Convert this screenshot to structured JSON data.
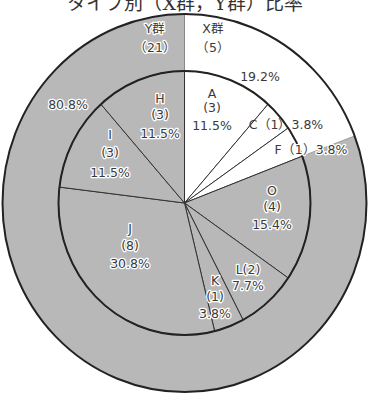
{
  "chart_data": {
    "type": "pie",
    "subtype": "double-ring (nested pie)",
    "title": "タイプ別（X群，Y群）比率",
    "title_visible_partial": true,
    "total": 26,
    "outer_ring": [
      {
        "name": "X群",
        "count": 5,
        "percent": 19.2,
        "color": "#ffffff"
      },
      {
        "name": "Y群",
        "count": 21,
        "percent": 80.8,
        "color": "#b8b8b8"
      }
    ],
    "inner_pie": [
      {
        "name": "A",
        "count": 3,
        "percent": 11.5,
        "group": "X群",
        "color": "#ffffff"
      },
      {
        "name": "C",
        "count": 1,
        "percent": 3.8,
        "group": "X群",
        "color": "#ffffff"
      },
      {
        "name": "F",
        "count": 1,
        "percent": 3.8,
        "group": "X群",
        "color": "#ffffff"
      },
      {
        "name": "O",
        "count": 4,
        "percent": 15.4,
        "group": "Y群",
        "color": "#b8b8b8"
      },
      {
        "name": "L",
        "count": 2,
        "percent": 7.7,
        "group": "Y群",
        "color": "#b8b8b8"
      },
      {
        "name": "K",
        "count": 1,
        "percent": 3.8,
        "group": "Y群",
        "color": "#b8b8b8"
      },
      {
        "name": "J",
        "count": 8,
        "percent": 30.8,
        "group": "Y群",
        "color": "#b8b8b8"
      },
      {
        "name": "I",
        "count": 3,
        "percent": 11.5,
        "group": "Y群",
        "color": "#b8b8b8"
      },
      {
        "name": "H",
        "count": 3,
        "percent": 11.5,
        "group": "Y群",
        "color": "#b8b8b8"
      }
    ],
    "start_angle": "12 o'clock",
    "direction": "clockwise"
  },
  "labels": {
    "x_group": {
      "name": "X群",
      "count": "（5）",
      "percent": "19.2%"
    },
    "y_group": {
      "name": "Y群",
      "count": "（21）",
      "percent": "80.8%"
    },
    "A": {
      "name": "A",
      "count": "(3)",
      "percent": "11.5%"
    },
    "C": {
      "text": "C（1）3.8%"
    },
    "F": {
      "text": "F（1）3.8%"
    },
    "O": {
      "name": "O",
      "count": "(4)",
      "percent": "15.4%"
    },
    "L": {
      "name": "L(2)",
      "percent": "7.7%"
    },
    "K": {
      "name": "K",
      "count": "(1)",
      "percent": "3.8%"
    },
    "J": {
      "name": "J",
      "count": "(8)",
      "percent": "30.8%"
    },
    "I": {
      "name": "I",
      "count": "(3)",
      "percent": "11.5%"
    },
    "H": {
      "name": "H",
      "count": "(3)",
      "percent": "11.5%"
    }
  },
  "colors": {
    "gray_fill": "#b8b8b8",
    "white_fill": "#ffffff",
    "stroke": "#222222"
  }
}
